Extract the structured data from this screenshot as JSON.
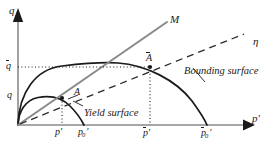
{
  "figure": {
    "kind": "bounding-surface-plasticity-diagram",
    "width": 279,
    "height": 146,
    "background": "#ffffff",
    "ink": "#1a1a1a",
    "gray": "#8a8a8a"
  },
  "axes": {
    "x_label": "p'",
    "y_label": "q",
    "origin_label": "",
    "x_axis_color": "#8a8a8a",
    "y_axis_color": "#8a8a8a"
  },
  "ticks": {
    "y": [
      {
        "id": "q-bar",
        "base": "q",
        "overbar": true,
        "value_note": "deviator stress on bounding surface at image point"
      },
      {
        "id": "q",
        "base": "q",
        "overbar": false,
        "value_note": "deviator stress on yield surface at current point"
      }
    ],
    "x": [
      {
        "id": "p-prime",
        "base": "p",
        "prime": true,
        "overbar": false,
        "subscript": "",
        "value_note": "current mean effective stress"
      },
      {
        "id": "p0-prime",
        "base": "p",
        "prime": true,
        "overbar": false,
        "subscript": "0",
        "value_note": "yield surface size"
      },
      {
        "id": "p-bar-prime",
        "base": "p",
        "prime": true,
        "overbar": true,
        "subscript": "",
        "value_note": "image mean effective stress"
      },
      {
        "id": "p0-bar-prime",
        "base": "p",
        "prime": true,
        "overbar": true,
        "subscript": "0",
        "value_note": "bounding surface size"
      }
    ]
  },
  "lines": [
    {
      "id": "critical-state-line",
      "label": "M",
      "overbar": false,
      "style": "solid-gray",
      "note": "critical state line of slope M through origin"
    },
    {
      "id": "stress-ratio-line",
      "label": "η",
      "overbar": false,
      "style": "dashed",
      "note": "radial mapping line of stress ratio eta"
    }
  ],
  "curves": [
    {
      "id": "yield-surface",
      "label": "Yield surface",
      "style": "solid-black"
    },
    {
      "id": "bounding-surface",
      "label": "Bounding surface",
      "style": "solid-black"
    }
  ],
  "points": [
    {
      "id": "point-A",
      "label": "A",
      "overbar": false,
      "on": "yield-surface",
      "note": "current stress state"
    },
    {
      "id": "point-A-bar",
      "label": "A",
      "overbar": true,
      "on": "bounding-surface",
      "note": "image stress state"
    }
  ],
  "guides": [
    {
      "id": "guide-q-bar-horizontal",
      "style": "dotted",
      "note": "horizontal dotted line from q-bar tick to image point"
    },
    {
      "id": "guide-p-bar-vertical",
      "style": "dotted",
      "note": "vertical dotted line from image point down to p-bar-prime"
    },
    {
      "id": "guide-p-vertical",
      "style": "dotted",
      "note": "vertical dotted line from point A down to p-prime"
    }
  ]
}
